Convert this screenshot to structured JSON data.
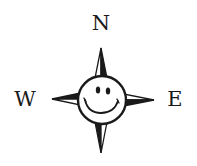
{
  "compass": {
    "labels": {
      "north": "N",
      "west": "W",
      "east": "E"
    },
    "center_icon": "smiley-face-icon",
    "colors": {
      "ink": "#1a1a1a",
      "background": "#ffffff"
    }
  }
}
